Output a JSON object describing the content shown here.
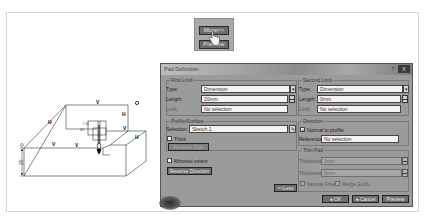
{
  "more_snippet": {
    "top_button": "More>>",
    "bottom_button": "Preview",
    "cursor": "hand-pointer-icon"
  },
  "figure": {
    "edge_labels": [
      "V",
      "H",
      "V",
      "H",
      "V",
      "H",
      "V",
      "H"
    ],
    "point_label": "O",
    "dimension_value": "20",
    "inner_labels": [
      "L30",
      "45"
    ]
  },
  "dialog": {
    "title": "Pad Definition",
    "help_label": "?",
    "close_label": "X",
    "first_limit": {
      "group_label": "First Limit",
      "type_label": "Type:",
      "type_value": "Dimension",
      "length_label": "Length:",
      "length_value": "20mm",
      "limit_label": "Limit:",
      "limit_value": "No selection"
    },
    "profile_surface": {
      "group_label": "Profile/Surface",
      "selection_label": "Selection:",
      "selection_value": "Sketch.1",
      "thick_label": "Thick",
      "thick_checked": false,
      "reverse_side_label": "Reverse Side"
    },
    "mirrored_extent_label": "Mirrored extent",
    "mirrored_extent_checked": false,
    "reverse_direction_label": "Reverse Direction",
    "less_button_label": "<<Less",
    "second_limit": {
      "group_label": "Second Limit",
      "type_label": "Type:",
      "type_value": "Dimension",
      "length_label": "Length:",
      "length_value": "0mm",
      "limit_label": "Limit:",
      "limit_value": "No selection"
    },
    "direction": {
      "group_label": "Direction",
      "normal_label": "Normal to profile",
      "normal_checked": true,
      "reference_label": "Reference:",
      "reference_value": "No selection"
    },
    "thin_pad": {
      "group_label": "Thin Pad",
      "thickness1_label": "Thickness1:",
      "thickness1_value": "1mm",
      "thickness2_label": "Thickness2:",
      "thickness2_value": "0mm",
      "neutral_fiber_label": "Neutral Fiber",
      "merge_ends_label": "Merge Ends"
    },
    "ok_label": "OK",
    "cancel_label": "Cancel",
    "preview_label": "Preview"
  }
}
